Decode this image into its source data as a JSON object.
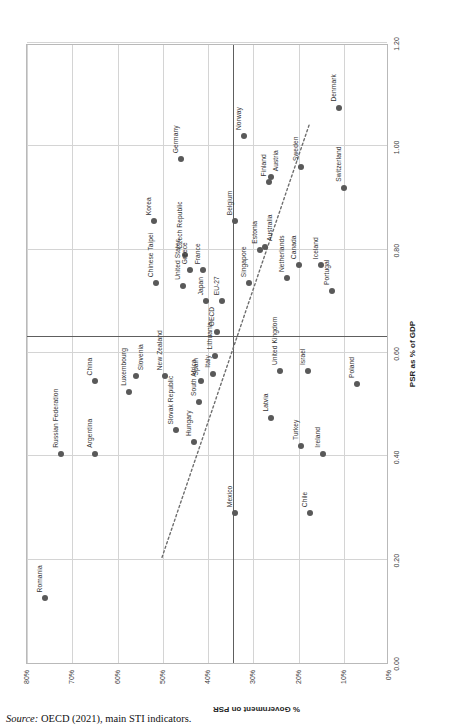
{
  "figure": {
    "source_prefix": "Source:",
    "source_text": " OECD (2021), main STI indicators."
  },
  "chart_data": {
    "type": "scatter",
    "title": "",
    "xlabel": "PSR as % of GDP",
    "ylabel": "% Government on PSR",
    "xlim": [
      0.0,
      1.2
    ],
    "ylim": [
      0,
      80
    ],
    "xticks": [
      "0.00",
      "0.20",
      "0.40",
      "0.60",
      "0.80",
      "1.00",
      "1.20"
    ],
    "xtickvals": [
      0.0,
      0.2,
      0.4,
      0.6,
      0.8,
      1.0,
      1.2
    ],
    "yticks": [
      "0%",
      "10%",
      "20%",
      "30%",
      "40%",
      "50%",
      "60%",
      "70%",
      "80%"
    ],
    "ytickvals": [
      0,
      10,
      20,
      30,
      40,
      50,
      60,
      70,
      80
    ],
    "grid": true,
    "legend": "none",
    "reference_lines": {
      "vertical_x": 0.63,
      "horizontal_y": 34.5
    },
    "trendline": {
      "style": "dotted",
      "x_start": 0.205,
      "y_start": 50.0,
      "x_end": 1.045,
      "y_end": 17.3
    },
    "points": [
      {
        "name": "Romania",
        "x": 0.125,
        "y": 76.0,
        "label_pos": "above"
      },
      {
        "name": "Russian Federation",
        "x": 0.405,
        "y": 72.5,
        "label_pos": "above"
      },
      {
        "name": "Argentina",
        "x": 0.405,
        "y": 65.0,
        "label_pos": "above"
      },
      {
        "name": "China",
        "x": 0.545,
        "y": 65.0,
        "label_pos": "above"
      },
      {
        "name": "Luxembourg",
        "x": 0.525,
        "y": 57.5,
        "label_pos": "above"
      },
      {
        "name": "Slovenia",
        "x": 0.555,
        "y": 56.0,
        "label_pos": "below"
      },
      {
        "name": "Chinese Taipei",
        "x": 0.735,
        "y": 51.5,
        "label_pos": "above"
      },
      {
        "name": "Korea",
        "x": 0.855,
        "y": 52.0,
        "label_pos": "above"
      },
      {
        "name": "New Zealand",
        "x": 0.555,
        "y": 49.5,
        "label_pos": "above"
      },
      {
        "name": "Slovak Republic",
        "x": 0.45,
        "y": 47.0,
        "label_pos": "above"
      },
      {
        "name": "United States",
        "x": 0.73,
        "y": 45.5,
        "label_pos": "above"
      },
      {
        "name": "Germany",
        "x": 0.975,
        "y": 46.0,
        "label_pos": "above"
      },
      {
        "name": "Czech Republic",
        "x": 0.79,
        "y": 45.0,
        "label_pos": "above"
      },
      {
        "name": "Greece",
        "x": 0.76,
        "y": 44.0,
        "label_pos": "above"
      },
      {
        "name": "Hungary",
        "x": 0.428,
        "y": 43.0,
        "label_pos": "above"
      },
      {
        "name": "South Africa",
        "x": 0.505,
        "y": 42.0,
        "label_pos": "above"
      },
      {
        "name": "Spain",
        "x": 0.545,
        "y": 41.5,
        "label_pos": "above"
      },
      {
        "name": "Japan",
        "x": 0.7,
        "y": 40.5,
        "label_pos": "above"
      },
      {
        "name": "France",
        "x": 0.76,
        "y": 41.0,
        "label_pos": "above"
      },
      {
        "name": "Italy",
        "x": 0.56,
        "y": 39.0,
        "label_pos": "above"
      },
      {
        "name": "Lithuania",
        "x": 0.595,
        "y": 38.5,
        "label_pos": "above"
      },
      {
        "name": "OECD",
        "x": 0.64,
        "y": 38.0,
        "label_pos": "above"
      },
      {
        "name": "EU-27",
        "x": 0.7,
        "y": 37.0,
        "label_pos": "above"
      },
      {
        "name": "Belgium",
        "x": 0.855,
        "y": 34.0,
        "label_pos": "above"
      },
      {
        "name": "Mexico",
        "x": 0.29,
        "y": 34.0,
        "label_pos": "above"
      },
      {
        "name": "Singapore",
        "x": 0.735,
        "y": 31.0,
        "label_pos": "above"
      },
      {
        "name": "Norway",
        "x": 1.02,
        "y": 32.0,
        "label_pos": "above"
      },
      {
        "name": "Estonia",
        "x": 0.8,
        "y": 28.5,
        "label_pos": "above"
      },
      {
        "name": "Australia",
        "x": 0.805,
        "y": 27.5,
        "label_pos": "below"
      },
      {
        "name": "Finland",
        "x": 0.93,
        "y": 26.5,
        "label_pos": "above"
      },
      {
        "name": "Austria",
        "x": 0.94,
        "y": 26.0,
        "label_pos": "below"
      },
      {
        "name": "Latvia",
        "x": 0.475,
        "y": 26.0,
        "label_pos": "above"
      },
      {
        "name": "United Kingdom",
        "x": 0.565,
        "y": 24.0,
        "label_pos": "above"
      },
      {
        "name": "Netherlands",
        "x": 0.745,
        "y": 22.5,
        "label_pos": "above"
      },
      {
        "name": "Canada",
        "x": 0.77,
        "y": 20.0,
        "label_pos": "above"
      },
      {
        "name": "Sweden",
        "x": 0.96,
        "y": 19.5,
        "label_pos": "above"
      },
      {
        "name": "Turkey",
        "x": 0.42,
        "y": 19.5,
        "label_pos": "above"
      },
      {
        "name": "Israel",
        "x": 0.565,
        "y": 18.0,
        "label_pos": "above"
      },
      {
        "name": "Chile",
        "x": 0.29,
        "y": 17.5,
        "label_pos": "above"
      },
      {
        "name": "Iceland",
        "x": 0.77,
        "y": 15.0,
        "label_pos": "above"
      },
      {
        "name": "Ireland",
        "x": 0.405,
        "y": 14.5,
        "label_pos": "above"
      },
      {
        "name": "Portugal",
        "x": 0.72,
        "y": 12.5,
        "label_pos": "above"
      },
      {
        "name": "Switzerland",
        "x": 0.92,
        "y": 10.0,
        "label_pos": "above"
      },
      {
        "name": "Denmark",
        "x": 1.075,
        "y": 11.0,
        "label_pos": "above"
      },
      {
        "name": "Poland",
        "x": 0.54,
        "y": 7.0,
        "label_pos": "above"
      }
    ]
  }
}
